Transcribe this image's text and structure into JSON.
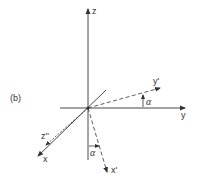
{
  "figure": {
    "panel_label": "(b)",
    "colors": {
      "line": "#333333",
      "background": "#ffffff"
    },
    "axes": {
      "z": {
        "label": "z",
        "style": "solid"
      },
      "y": {
        "label": "y",
        "style": "solid"
      },
      "x": {
        "label": "x",
        "style": "solid"
      },
      "y_prime": {
        "label": "y'",
        "style": "dashed"
      },
      "x_prime": {
        "label": "x'",
        "style": "dashed"
      },
      "z_double_prime": {
        "label": "z''",
        "style": "dashed"
      }
    },
    "angles": [
      {
        "label": "α",
        "between": [
          "y",
          "y'"
        ]
      },
      {
        "label": "α",
        "between": [
          "z (negative)",
          "x'"
        ]
      }
    ]
  }
}
